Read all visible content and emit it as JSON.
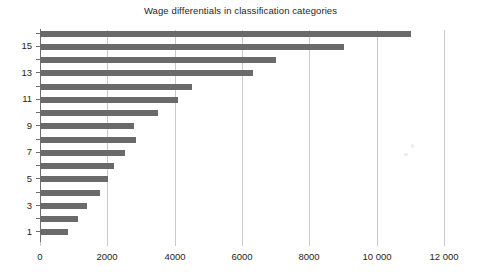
{
  "chart_data": {
    "type": "bar",
    "orientation": "horizontal",
    "title": "Wage differentials in classification categories",
    "xlabel": "",
    "ylabel": "",
    "categories": [
      "1",
      "2",
      "3",
      "4",
      "5",
      "6",
      "7",
      "8",
      "9",
      "10",
      "11",
      "12",
      "13",
      "14",
      "15",
      "16"
    ],
    "values": [
      830,
      1130,
      1390,
      1780,
      2020,
      2200,
      2530,
      2850,
      2790,
      3500,
      4100,
      4500,
      6320,
      7000,
      9020,
      11030
    ],
    "series": [
      {
        "name": "Wage differential",
        "values": [
          830,
          1130,
          1390,
          1780,
          2020,
          2200,
          2530,
          2850,
          2790,
          3500,
          4100,
          4500,
          6320,
          7000,
          9020,
          11030
        ]
      }
    ],
    "xlim": [
      0,
      12000
    ],
    "x_ticks": [
      0,
      2000,
      4000,
      6000,
      8000,
      10000,
      12000
    ],
    "x_tick_labels": [
      "0",
      "2000",
      "4000",
      "6000",
      "8000",
      "10 000",
      "12 000"
    ],
    "y_tick_labels": [
      "1",
      "3",
      "5",
      "7",
      "9",
      "11",
      "13",
      "15"
    ],
    "y_labeled_categories": [
      "1",
      "3",
      "5",
      "7",
      "9",
      "11",
      "13",
      "15"
    ],
    "grid": "vertical",
    "legend": "none",
    "bar_color": "#6a6a6a",
    "grid_color": "#c9cacc",
    "axis_color": "#6d6e71",
    "background": "#ffffff"
  }
}
